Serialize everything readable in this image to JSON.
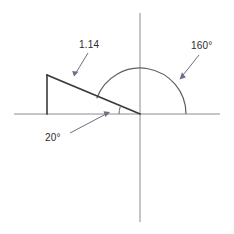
{
  "figure": {
    "type": "geometry-diagram",
    "background_color": "#ffffff",
    "axis_color": "#8c8c8c",
    "shape_color": "#3a3a3a",
    "leader_color": "#6f6f84",
    "text_color": "#2b2b2b"
  },
  "labels": {
    "hypotenuse_length": "1.14",
    "arc_angle": "160°",
    "base_angle": "20°"
  },
  "geometry": {
    "origin": {
      "x": 140,
      "y": 114
    },
    "x_axis": {
      "x1": 14,
      "y1": 114,
      "x2": 220,
      "y2": 114
    },
    "y_axis": {
      "x1": 140,
      "y1": 13,
      "x2": 140,
      "y2": 222
    },
    "triangle": {
      "apex": {
        "x": 47,
        "y": 75
      },
      "foot": {
        "x": 47,
        "y": 114
      },
      "vertex": {
        "x": 140,
        "y": 114
      }
    },
    "arc": {
      "center": {
        "x": 140,
        "y": 114
      },
      "radius": 46,
      "start_angle_deg": 0,
      "end_angle_deg": 160
    },
    "small_angle_arc": {
      "center": {
        "x": 140,
        "y": 114
      },
      "radius": 21,
      "start_angle_deg": 160,
      "end_angle_deg": 180
    }
  },
  "annotations": [
    {
      "name": "length-leader",
      "from": {
        "x": 88,
        "y": 53
      },
      "to": {
        "x": 74,
        "y": 76
      }
    },
    {
      "name": "arc-angle-leader",
      "from": {
        "x": 199,
        "y": 55
      },
      "to": {
        "x": 180,
        "y": 79
      }
    },
    {
      "name": "base-angle-leader",
      "from": {
        "x": 70,
        "y": 133
      },
      "to": {
        "x": 109,
        "y": 112
      }
    }
  ]
}
